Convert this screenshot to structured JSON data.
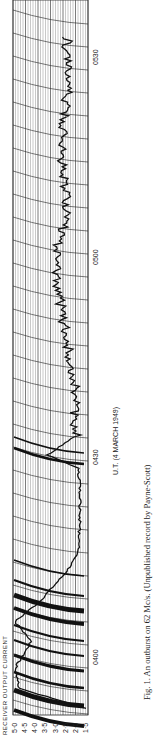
{
  "figure": {
    "caption": "Fig. 1. An outburst on 62 Mc/s. (Unpublished record by Payne-Scott)",
    "caption_parts": {
      "label": "Fig. 1.",
      "text": "An outburst on 62 Mc/s.",
      "note": "(Unpublished record by Payne-Scott)"
    }
  },
  "chart_data": {
    "type": "line",
    "title": "An outburst on 62 Mc/s",
    "xlabel": "U.T. (4 MARCH 1949)",
    "ylabel": "RECEIVER OUTPUT CURRENT",
    "x_ticks": [
      "0400",
      "0430",
      "0500",
      "0530"
    ],
    "y_ticks": [
      "1·5",
      "2·0",
      "2·5",
      "3·0",
      "3·5",
      "4·0",
      "4·5",
      "5·0"
    ],
    "ylim": [
      1.5,
      5.0
    ],
    "grid": true,
    "orientation": "rotated 90° counter-clockwise",
    "series": [
      {
        "name": "receiver output",
        "x": [
          "0352",
          "0355",
          "0358",
          "0400",
          "0402",
          "0405",
          "0408",
          "0412",
          "0415",
          "0420",
          "0425",
          "0428",
          "0430",
          "0433",
          "0436",
          "0440",
          "0445",
          "0450",
          "0455",
          "0500",
          "0503",
          "0506",
          "0510",
          "0515",
          "0520",
          "0525",
          "0530",
          "0533"
        ],
        "values": [
          1.5,
          4.8,
          5.0,
          4.6,
          4.2,
          5.0,
          3.8,
          2.6,
          1.9,
          1.8,
          1.8,
          1.9,
          3.4,
          2.0,
          2.1,
          2.0,
          2.3,
          2.6,
          2.9,
          3.0,
          2.8,
          2.4,
          2.5,
          2.7,
          2.6,
          2.4,
          2.5,
          2.4
        ]
      }
    ]
  },
  "axes": {
    "y_label": "RECEIVER OUTPUT CURRENT",
    "y_ticks": [
      "5·0",
      "4·5",
      "4·0",
      "3·5",
      "3·0",
      "2·5",
      "2·0",
      "1·5"
    ],
    "x_label": "U.T. (4 MARCH 1949)",
    "x_ticks": [
      "0400",
      "0430",
      "0500",
      "0530"
    ]
  }
}
